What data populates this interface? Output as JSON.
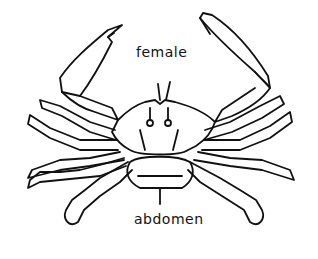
{
  "diagram": {
    "labels": {
      "female": "female",
      "abdomen": "abdomen"
    },
    "colors": {
      "stroke": "#111111",
      "background": "#ffffff"
    }
  }
}
